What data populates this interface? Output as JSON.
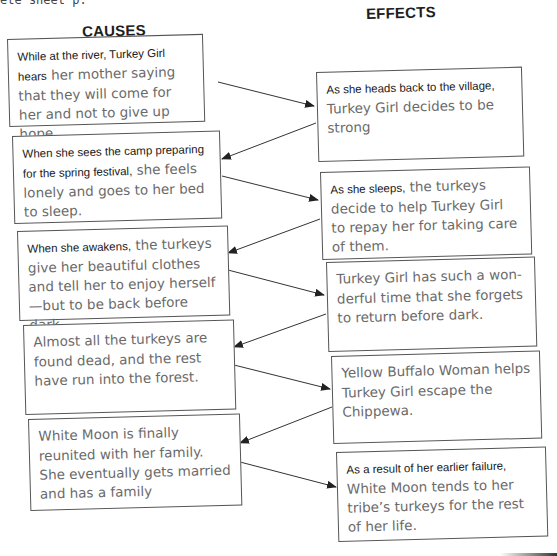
{
  "page": {
    "top_fragment": "ete sheet p.",
    "headings": {
      "causes": "CAUSES",
      "effects": "EFFECTS"
    }
  },
  "causes": [
    {
      "lead": "While at the river, Turkey Girl hears",
      "text": "her mother saying that they will come for her and not to give up hope."
    },
    {
      "lead": "When she sees the camp preparing for the spring festival,",
      "text": "she feels lonely and goes to her bed to sleep."
    },
    {
      "lead": "When she awakens,",
      "text": "the turkeys give her beautiful clothes and tell her to enjoy herself—but to be back before dark."
    },
    {
      "lead": "",
      "text": "Almost all the turkeys are found dead, and the rest have run into the forest."
    },
    {
      "lead": "",
      "text": "White Moon is finally reunited with her family. She eventually gets married and has a family"
    }
  ],
  "effects": [
    {
      "lead": "As she heads back to the village,",
      "text": "Turkey Girl decides to be strong"
    },
    {
      "lead": "As she sleeps,",
      "text": "the turkeys decide to help Turkey Girl to repay her for taking care of them."
    },
    {
      "lead": "",
      "text": "Turkey Girl has such a won-derful time that she forgets to return before dark."
    },
    {
      "lead": "",
      "text": "Yellow Buffalo Woman helps Turkey Girl escape the Chippewa."
    },
    {
      "lead": "As a result of her earlier failure,",
      "text": "White Moon tends to her tribe’s turkeys for the rest of her life."
    }
  ],
  "colors": {
    "heading": "#1e1e1e",
    "lead_text": "#1a1a1a",
    "body_text": "#6a6a6a",
    "border": "#555555",
    "arrow": "#333333"
  }
}
